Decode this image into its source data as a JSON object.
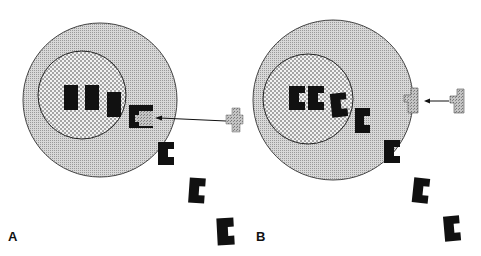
{
  "figure": {
    "panels": [
      {
        "label": "A",
        "description": "Cell with receptor binding ligand; three bound blocks in nucleus region"
      },
      {
        "label": "B",
        "description": "Cell with C-shaped ligands internalized; T-shaped receptor at membrane"
      }
    ]
  },
  "colors": {
    "outer_fill": "#c8c8c8",
    "inner_fill": "#e6e6e6",
    "shape_black": "#111111",
    "receptor_gray": "#b5b5b5",
    "stroke": "#333333"
  }
}
